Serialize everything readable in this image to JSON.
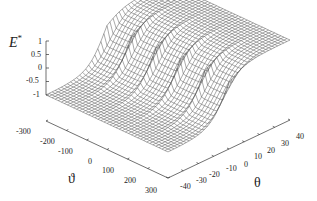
{
  "chart_data": {
    "type": "surface3d",
    "title": "",
    "zlabel": "E*",
    "xlabel": "ϑ",
    "ylabel": "θ",
    "x_ticks": [
      "-300",
      "-200",
      "-100",
      "0",
      "100",
      "200",
      "300"
    ],
    "y_ticks": [
      "-40",
      "-30",
      "-20",
      "-10",
      "0",
      "10",
      "20",
      "30",
      "40"
    ],
    "z_ticks": [
      "1",
      "0.5",
      "0",
      "-0.5",
      "-1"
    ],
    "xlim": [
      -300,
      300
    ],
    "ylim": [
      -40,
      40
    ],
    "zlim": [
      -1,
      1
    ],
    "grid": false,
    "legend": "none",
    "mesh": {
      "nx": 41,
      "ny": 41
    },
    "colors": {
      "mesh": "#555555",
      "axes": "#333333"
    }
  },
  "labels": {
    "z_title": "E",
    "z_title_sup": "*",
    "x_title": "ϑ",
    "y_title": "θ"
  }
}
